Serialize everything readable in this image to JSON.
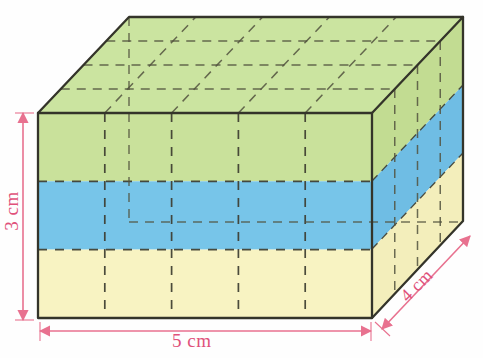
{
  "figure": {
    "kind": "rectangular-prism-volume-diagram",
    "dimensions": {
      "width_label": "5 cm",
      "depth_label": "4 cm",
      "height_label": "3 cm",
      "width_units": 5,
      "depth_units": 4,
      "height_units": 3
    },
    "layers": [
      {
        "name": "top-layer",
        "color_name": "green",
        "color": "#c9e19b",
        "rows": 1
      },
      {
        "name": "middle-layer",
        "color_name": "blue",
        "color": "#77c5e9",
        "rows": 1
      },
      {
        "name": "bottom-layer",
        "color_name": "yellow",
        "color": "#f8f3c2",
        "rows": 1
      }
    ],
    "colors": {
      "green": "#c9e19b",
      "blue": "#77c5e9",
      "yellow": "#f8f3c2",
      "green_top": "#cbe4a0",
      "green_side": "#c2dc92",
      "blue_side": "#6fbde4",
      "yellow_side": "#f3eebb",
      "edge": "#3a3a30",
      "dashed": "#4a4a3c",
      "dimension_arrow": "#e8718f",
      "dimension_text": "#e0517a",
      "background": "#fefefe"
    },
    "geometry": {
      "front_top_left": [
        38,
        113
      ],
      "front_top_right": [
        372,
        113
      ],
      "front_bottom_left": [
        38,
        318
      ],
      "front_bottom_right": [
        372,
        318
      ],
      "depth_offset_x": 91,
      "depth_offset_y": -96
    }
  }
}
